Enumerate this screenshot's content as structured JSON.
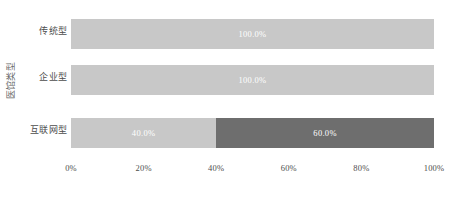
{
  "chart_data": {
    "type": "bar",
    "orientation": "horizontal",
    "stacked": true,
    "title": "",
    "xlabel": "",
    "ylabel": "医馆类型",
    "categories": [
      "传统型",
      "企业型",
      "互联网型"
    ],
    "xlim": [
      0,
      100
    ],
    "xticks": [
      0,
      20,
      40,
      60,
      80,
      100
    ],
    "xtick_labels": [
      "0%",
      "20%",
      "40%",
      "60%",
      "80%",
      "100%"
    ],
    "grid": false,
    "legend": "none",
    "series": [
      {
        "name": "segment-1",
        "color": "#c8c8c8",
        "values": [
          100.0,
          100.0,
          40.0
        ],
        "labels": [
          "100.0%",
          "100.0%",
          "40.0%"
        ]
      },
      {
        "name": "segment-2",
        "color": "#6e6e6e",
        "values": [
          0.0,
          0.0,
          60.0
        ],
        "labels": [
          "",
          "",
          "60.0%"
        ]
      }
    ],
    "bars": [
      {
        "category": "传统型",
        "segments": [
          {
            "value": 100.0,
            "label": "100.0%",
            "color": "#c8c8c8"
          }
        ]
      },
      {
        "category": "企业型",
        "segments": [
          {
            "value": 100.0,
            "label": "100.0%",
            "color": "#c8c8c8"
          }
        ]
      },
      {
        "category": "互联网型",
        "segments": [
          {
            "value": 40.0,
            "label": "40.0%",
            "color": "#c8c8c8"
          },
          {
            "value": 60.0,
            "label": "60.0%",
            "color": "#6e6e6e"
          }
        ]
      }
    ]
  },
  "colors": {
    "background": "#ffffff",
    "segment_light": "#c8c8c8",
    "segment_dark": "#6e6e6e",
    "data_label": "#ffffff",
    "tick_text": "#4d4d4d",
    "axis_title": "#6b6b6b"
  }
}
